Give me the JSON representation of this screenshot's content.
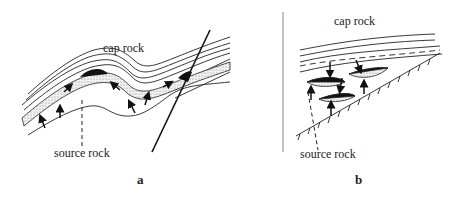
{
  "panels": [
    {
      "id": "a",
      "label": "a",
      "annotations": {
        "top": "cap rock",
        "bottom": "source rock"
      },
      "elements": [
        "folded strata (anticline)",
        "reservoir layer (stippled)",
        "oil accumulations (black)",
        "migration arrows",
        "fault line"
      ]
    },
    {
      "id": "b",
      "label": "b",
      "annotations": {
        "top": "cap rock",
        "bottom": "source rock"
      },
      "elements": [
        "cap rock strata",
        "lens-shaped reservoirs",
        "migration arrows",
        "unconformity surface (hachured)"
      ]
    }
  ],
  "colors": {
    "line": "#222222",
    "stipple": "#bdbdbd",
    "oil": "#111111",
    "background": "#ffffff"
  }
}
